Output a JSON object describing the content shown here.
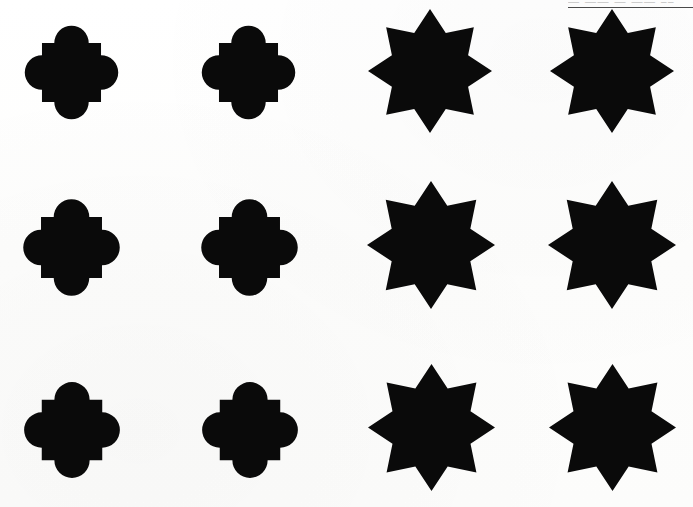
{
  "page": {
    "width": 693,
    "height": 507,
    "background_color": "#fdfdfd",
    "ink_color": "#0a0a0a"
  },
  "header": {
    "clipped_text": "— —— — —— ––",
    "rule_color": "#4a4a4a",
    "note": "cut-off running head fragment at top right with horizontal rule"
  },
  "grid": {
    "rows": 3,
    "columns": 4,
    "row_labels": [
      "row-1",
      "row-2",
      "row-3"
    ],
    "column_labels": [
      "column-1",
      "column-2",
      "column-3",
      "column-4"
    ]
  },
  "shape_types": {
    "lobed-square": {
      "name": "lobed-square",
      "description": "square with a semicircular lobe centered on each of the four sides",
      "lobe_count": 4,
      "fill": "#0a0a0a"
    },
    "octagram-star": {
      "name": "octagram-star",
      "description": "eight-pointed star formed by two overlapping squares rotated 45 degrees",
      "point_count": 8,
      "fill": "#0a0a0a"
    }
  },
  "shapes": [
    {
      "id": "shape-r1c1",
      "type": "lobed-square",
      "row": 1,
      "column": 1,
      "x": 10,
      "y": 11,
      "w": 123,
      "h": 123
    },
    {
      "id": "shape-r1c2",
      "type": "lobed-square",
      "row": 1,
      "column": 2,
      "x": 187,
      "y": 11,
      "w": 123,
      "h": 123
    },
    {
      "id": "shape-r1c3",
      "type": "octagram-star",
      "row": 1,
      "column": 3,
      "x": 368,
      "y": 9,
      "w": 124,
      "h": 124
    },
    {
      "id": "shape-r1c4",
      "type": "octagram-star",
      "row": 1,
      "column": 4,
      "x": 550,
      "y": 9,
      "w": 124,
      "h": 124
    },
    {
      "id": "shape-r2c1",
      "type": "lobed-square",
      "row": 2,
      "column": 1,
      "x": 8,
      "y": 184,
      "w": 127,
      "h": 127
    },
    {
      "id": "shape-r2c2",
      "type": "lobed-square",
      "row": 2,
      "column": 2,
      "x": 186,
      "y": 184,
      "w": 127,
      "h": 127
    },
    {
      "id": "shape-r2c3",
      "type": "octagram-star",
      "row": 2,
      "column": 3,
      "x": 367,
      "y": 181,
      "w": 128,
      "h": 128
    },
    {
      "id": "shape-r2c4",
      "type": "octagram-star",
      "row": 2,
      "column": 4,
      "x": 548,
      "y": 181,
      "w": 128,
      "h": 128
    },
    {
      "id": "shape-r3c1",
      "type": "lobed-square",
      "row": 3,
      "column": 1,
      "x": 9,
      "y": 367,
      "w": 126,
      "h": 126
    },
    {
      "id": "shape-r3c2",
      "type": "lobed-square",
      "row": 3,
      "column": 2,
      "x": 187,
      "y": 367,
      "w": 126,
      "h": 126
    },
    {
      "id": "shape-r3c3",
      "type": "octagram-star",
      "row": 3,
      "column": 3,
      "x": 368,
      "y": 364,
      "w": 127,
      "h": 127
    },
    {
      "id": "shape-r3c4",
      "type": "octagram-star",
      "row": 3,
      "column": 4,
      "x": 549,
      "y": 364,
      "w": 127,
      "h": 127
    }
  ]
}
